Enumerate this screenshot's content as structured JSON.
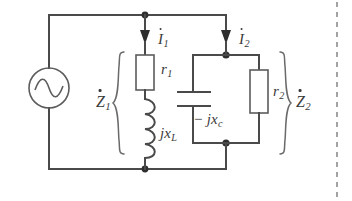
{
  "figure": {
    "type": "ac-circuit-schematic",
    "background_color": "#ffffff",
    "line_color": "#4a4a4a"
  },
  "source": {
    "name": "ac-voltage-source",
    "symbol": "sine-wave-in-circle"
  },
  "currents": [
    {
      "id": "i1",
      "label": "I",
      "subscript": "1",
      "direction": "down"
    },
    {
      "id": "i2",
      "label": "I",
      "subscript": "2",
      "direction": "down"
    }
  ],
  "branches": [
    {
      "id": "z1",
      "label": "Z",
      "subscript": "1",
      "brace": "left",
      "components": [
        {
          "id": "r1",
          "kind": "resistor",
          "label": "r",
          "subscript": "1"
        },
        {
          "id": "jxl",
          "kind": "inductor",
          "label": "jx",
          "subscript": "L"
        }
      ]
    },
    {
      "id": "z2",
      "label": "Z",
      "subscript": "2",
      "brace": "right",
      "components": [
        {
          "id": "jxc",
          "kind": "capacitor",
          "label": "− jx",
          "subscript": "c"
        },
        {
          "id": "r2",
          "kind": "resistor",
          "label": "r",
          "subscript": "2"
        }
      ]
    }
  ],
  "labels": {
    "i1_main": "I",
    "i1_sub": "1",
    "i2_main": "I",
    "i2_sub": "2",
    "z1_main": "Z",
    "z1_sub": "1",
    "z2_main": "Z",
    "z2_sub": "2",
    "r1_main": "r",
    "r1_sub": "1",
    "r2_main": "r",
    "r2_sub": "2",
    "jxl_main": "jx",
    "jxl_sub": "L",
    "jxc_main": "− jx",
    "jxc_sub": "c"
  }
}
